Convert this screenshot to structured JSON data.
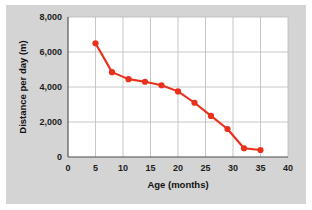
{
  "chart_data": {
    "type": "line",
    "title": "",
    "xlabel": "Age (months)",
    "ylabel": "Distance per day (m)",
    "xlim": [
      0,
      40
    ],
    "ylim": [
      0,
      8000
    ],
    "xticks": [
      0,
      5,
      10,
      15,
      20,
      25,
      30,
      35,
      40
    ],
    "xtick_labels": [
      "0",
      "5",
      "10",
      "15",
      "20",
      "25",
      "30",
      "35",
      "40"
    ],
    "yticks": [
      0,
      2000,
      4000,
      6000,
      8000
    ],
    "ytick_labels": [
      "0",
      "2,000",
      "4,000",
      "6,000",
      "8,000"
    ],
    "grid": true,
    "legend": "none",
    "series": [
      {
        "name": "Distance per day",
        "color": "#e8301a",
        "marker": "circle",
        "x": [
          5,
          8,
          11,
          14,
          17,
          20,
          23,
          26,
          29,
          32,
          35
        ],
        "values": [
          6500,
          4850,
          4450,
          4300,
          4100,
          3750,
          3100,
          2350,
          1600,
          500,
          400
        ]
      }
    ]
  },
  "colors": {
    "series": "#e8301a",
    "plot_background": "#ffffff",
    "figure_background": "#d4d4d4",
    "grid": "#b9b9b9",
    "axis": "#4a4a4a",
    "text": "#111111"
  }
}
